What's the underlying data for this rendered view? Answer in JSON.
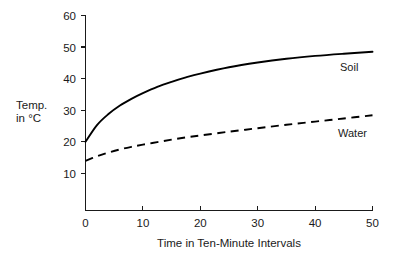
{
  "chart_data": {
    "type": "line",
    "title": "",
    "xlabel": "Time in Ten-Minute Intervals",
    "ylabel_lines": [
      "Temp.",
      "in °C"
    ],
    "ylabel": "Temp. in °C",
    "xlim": [
      0,
      50
    ],
    "ylim": [
      0,
      60
    ],
    "xticks": [
      0,
      10,
      20,
      30,
      40,
      50
    ],
    "yticks": [
      10,
      20,
      30,
      40,
      50,
      60
    ],
    "xtick_labels": [
      "0",
      "10",
      "20",
      "30",
      "40",
      "50"
    ],
    "ytick_labels": [
      "10",
      "20",
      "30",
      "40",
      "50",
      "60"
    ],
    "grid": false,
    "legend_position": "inline-right-of-curve",
    "x": [
      0,
      2,
      4,
      6,
      8,
      10,
      12.5,
      15,
      17.5,
      20,
      25,
      30,
      35,
      40,
      45,
      50
    ],
    "series": [
      {
        "name": "Soil",
        "style": "solid",
        "color": "#000000",
        "label": "Soil",
        "values": [
          20.0,
          25.3,
          28.8,
          31.5,
          33.6,
          35.4,
          37.4,
          39.0,
          40.4,
          41.6,
          43.6,
          45.1,
          46.3,
          47.2,
          47.9,
          48.5
        ]
      },
      {
        "name": "Water",
        "style": "dashed",
        "color": "#000000",
        "label": "Water",
        "values": [
          14.0,
          15.4,
          16.6,
          17.6,
          18.4,
          19.1,
          19.9,
          20.7,
          21.4,
          22.0,
          23.2,
          24.3,
          25.4,
          26.4,
          27.4,
          28.4
        ]
      }
    ]
  },
  "axes": {
    "y_axis_name": "temperature-axis",
    "x_axis_name": "time-axis"
  }
}
